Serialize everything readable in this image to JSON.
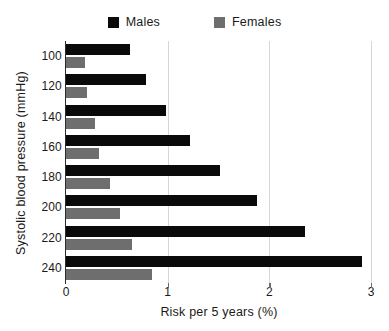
{
  "chart_data": {
    "type": "bar",
    "orientation": "horizontal",
    "title": "",
    "xlabel": "Risk per 5 years (%)",
    "ylabel": "Systolic blood pressure  (mmHg)",
    "categories": [
      "100",
      "120",
      "140",
      "160",
      "180",
      "200",
      "220",
      "240"
    ],
    "series": [
      {
        "name": "Males",
        "color": "#0a0a0a",
        "values": [
          0.63,
          0.79,
          0.98,
          1.22,
          1.51,
          1.88,
          2.35,
          2.91
        ]
      },
      {
        "name": "Females",
        "color": "#6e6e6e",
        "values": [
          0.19,
          0.21,
          0.29,
          0.32,
          0.43,
          0.53,
          0.65,
          0.85
        ]
      }
    ],
    "xlim": [
      0,
      3
    ],
    "xticks": [
      "0",
      "1",
      "2",
      "3"
    ],
    "xtick_values": [
      0,
      1,
      2,
      3
    ],
    "grid": "vertical-only",
    "legend_position": "top-center"
  },
  "legend": {
    "entries": [
      {
        "label": "Males",
        "swatch": "legend-swatch-males",
        "color": "#0a0a0a"
      },
      {
        "label": "Females",
        "swatch": "legend-swatch-females",
        "color": "#6e6e6e"
      }
    ]
  },
  "axes": {
    "x_title": "Risk per 5 years (%)",
    "y_title": "Systolic blood pressure  (mmHg)",
    "x_ticks": [
      "0",
      "1",
      "2",
      "3"
    ],
    "y_ticks": [
      "100",
      "120",
      "140",
      "160",
      "180",
      "200",
      "220",
      "240"
    ]
  },
  "colors": {
    "males": "#0a0a0a",
    "females": "#6e6e6e",
    "gridline": "#d6d6d6",
    "axis": "#2b2b2b",
    "background": "#ffffff"
  }
}
